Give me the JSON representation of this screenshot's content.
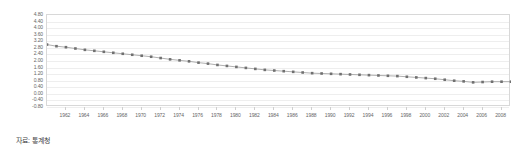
{
  "caption": {
    "source_text": "자료: 통계청"
  },
  "chart_data": {
    "type": "line",
    "title": "",
    "subtitle": "",
    "xlabel": "",
    "ylabel": "",
    "grid": true,
    "legend_position": "none",
    "marker": "square",
    "marker_color": "#707070",
    "line_color": "#9a9a9a",
    "gridline_color": "#eeeeee",
    "border_color": "#d8d8d8",
    "background_color": "#ffffff",
    "xlim": [
      1960,
      2009
    ],
    "ylim": [
      -0.8,
      4.8
    ],
    "y_tick_step": 0.4,
    "y_ticks": [
      "4.80",
      "4.40",
      "4.00",
      "3.60",
      "3.20",
      "2.80",
      "2.40",
      "2.00",
      "1.60",
      "1.20",
      "0.80",
      "0.40",
      "0.00",
      "-0.40",
      "-0.80"
    ],
    "y_tick_values": [
      4.8,
      4.4,
      4.0,
      3.6,
      3.2,
      2.8,
      2.4,
      2.0,
      1.6,
      1.2,
      0.8,
      0.4,
      0.0,
      -0.4,
      -0.8
    ],
    "x_tick_labels": [
      "1962",
      "1964",
      "1966",
      "1968",
      "1970",
      "1972",
      "1974",
      "1976",
      "1978",
      "1980",
      "1982",
      "1984",
      "1986",
      "1988",
      "1990",
      "1992",
      "1994",
      "1996",
      "1998",
      "2000",
      "2002",
      "2004",
      "2006",
      "2008"
    ],
    "x_tick_values": [
      1962,
      1964,
      1966,
      1968,
      1970,
      1972,
      1974,
      1976,
      1978,
      1980,
      1982,
      1984,
      1986,
      1988,
      1990,
      1992,
      1994,
      1996,
      1998,
      2000,
      2002,
      2004,
      2006,
      2008
    ],
    "x": [
      1960,
      1961,
      1962,
      1963,
      1964,
      1965,
      1966,
      1967,
      1968,
      1969,
      1970,
      1971,
      1972,
      1973,
      1974,
      1975,
      1976,
      1977,
      1978,
      1979,
      1980,
      1981,
      1982,
      1983,
      1984,
      1985,
      1986,
      1987,
      1988,
      1989,
      1990,
      1991,
      1992,
      1993,
      1994,
      1995,
      1996,
      1997,
      1998,
      1999,
      2000,
      2001,
      2002,
      2003,
      2004,
      2005,
      2006,
      2007,
      2008,
      2009
    ],
    "values": [
      3.0,
      2.9,
      2.84,
      2.76,
      2.68,
      2.62,
      2.56,
      2.5,
      2.44,
      2.38,
      2.32,
      2.26,
      2.18,
      2.1,
      2.04,
      1.98,
      1.9,
      1.84,
      1.76,
      1.7,
      1.64,
      1.58,
      1.52,
      1.46,
      1.42,
      1.38,
      1.34,
      1.3,
      1.26,
      1.24,
      1.22,
      1.2,
      1.18,
      1.16,
      1.14,
      1.12,
      1.1,
      1.08,
      1.04,
      1.0,
      0.96,
      0.92,
      0.86,
      0.8,
      0.76,
      0.7,
      0.72,
      0.74,
      0.74,
      0.74
    ],
    "series": [
      {
        "name": "합계출산율",
        "values": [
          3.0,
          2.9,
          2.84,
          2.76,
          2.68,
          2.62,
          2.56,
          2.5,
          2.44,
          2.38,
          2.32,
          2.26,
          2.18,
          2.1,
          2.04,
          1.98,
          1.9,
          1.84,
          1.76,
          1.7,
          1.64,
          1.58,
          1.52,
          1.46,
          1.42,
          1.38,
          1.34,
          1.3,
          1.26,
          1.24,
          1.22,
          1.2,
          1.18,
          1.16,
          1.14,
          1.12,
          1.1,
          1.08,
          1.04,
          1.0,
          0.96,
          0.92,
          0.86,
          0.8,
          0.76,
          0.7,
          0.72,
          0.74,
          0.74,
          0.74
        ]
      }
    ]
  }
}
